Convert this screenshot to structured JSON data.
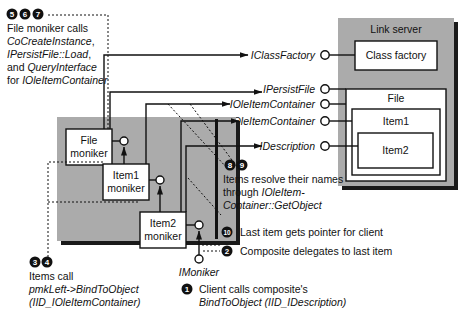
{
  "colors": {
    "shade": "#a9a9a9",
    "shade_dark": "#222222",
    "box_fill": "#ffffff",
    "line": "#111111"
  },
  "link_server": {
    "title": "Link server",
    "class_factory": "Class factory",
    "file": "File",
    "item1": "Item1",
    "item2": "Item2"
  },
  "monikers": {
    "file": [
      "File",
      "moniker"
    ],
    "item1": [
      "Item1",
      "moniker"
    ],
    "item2": [
      "Item2",
      "moniker"
    ],
    "interface": "IMoniker"
  },
  "interfaces": {
    "class_factory": "IClassFactory",
    "persist_file": "IPersistFile",
    "ole_item_container_1": "IOleItemContainer",
    "ole_item_container_2": "IOleItemContainer",
    "description": "IDescription"
  },
  "annotations": {
    "step567": {
      "numbers": [
        "5",
        "6",
        "7"
      ],
      "lines": [
        {
          "parts": [
            {
              "text": "File moniker calls",
              "italic": false
            }
          ]
        },
        {
          "parts": [
            {
              "text": "CoCreateInstance",
              "italic": true
            },
            {
              "text": ",",
              "italic": false
            }
          ]
        },
        {
          "parts": [
            {
              "text": "IPersistFile::Load",
              "italic": true
            },
            {
              "text": ",",
              "italic": false
            }
          ]
        },
        {
          "parts": [
            {
              "text": "and ",
              "italic": false
            },
            {
              "text": "QueryInterface",
              "italic": true
            }
          ]
        },
        {
          "parts": [
            {
              "text": "for ",
              "italic": false
            },
            {
              "text": "IOleItemContainer",
              "italic": true
            }
          ]
        }
      ]
    },
    "step89": {
      "numbers": [
        "8",
        "9"
      ],
      "line1": "Items resolve their names",
      "line2_plain": "through ",
      "line2_italic": "IOleItem-",
      "line3_italic": "Container::GetObject"
    },
    "step10": {
      "number": "10",
      "text": "Last item gets pointer for client"
    },
    "step2": {
      "number": "2",
      "text": "Composite delegates to last item"
    },
    "step34": {
      "numbers": [
        "3",
        "4"
      ],
      "line1": "Items call",
      "line2": "pmkLeft->BindToObject",
      "line3": "(IID_IOleItemContainer)"
    },
    "step1": {
      "number": "1",
      "line1": "Client calls composite's",
      "line2": "BindToObject (IID_IDescription)"
    }
  }
}
